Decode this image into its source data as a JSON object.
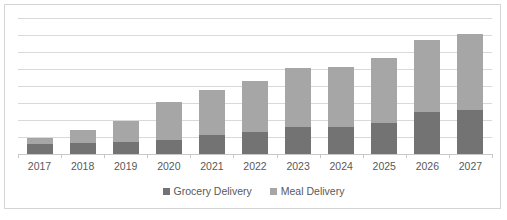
{
  "chart_data": {
    "type": "bar",
    "stacked": true,
    "title": "",
    "subtitle": "",
    "xlabel": "",
    "ylabel": "",
    "grid": true,
    "legend_position": "bottom",
    "ylim": [
      0,
      8
    ],
    "gridline_count": 9,
    "categories": [
      "2017",
      "2018",
      "2019",
      "2020",
      "2021",
      "2022",
      "2023",
      "2024",
      "2025",
      "2026",
      "2027"
    ],
    "series": [
      {
        "name": "Grocery Delivery",
        "color": "#737373",
        "values": [
          0.6,
          0.65,
          0.7,
          0.85,
          1.1,
          1.3,
          1.6,
          1.6,
          1.8,
          2.5,
          2.6
        ]
      },
      {
        "name": "Meal Delivery",
        "color": "#a6a6a6",
        "values": [
          0.35,
          0.75,
          1.25,
          2.2,
          2.65,
          3.0,
          3.45,
          3.5,
          3.85,
          4.2,
          4.45
        ]
      }
    ],
    "totals": [
      0.95,
      1.4,
      1.95,
      3.05,
      3.75,
      4.3,
      5.05,
      5.1,
      5.65,
      6.7,
      7.05
    ]
  },
  "legend": {
    "items": [
      {
        "label": "Grocery Delivery",
        "swatch": "grocery"
      },
      {
        "label": "Meal Delivery",
        "swatch": "meal"
      }
    ]
  },
  "colors": {
    "grocery": "#737373",
    "meal": "#a6a6a6",
    "gridline": "#d9d9d9",
    "border": "#d4d4d4",
    "text": "#595959",
    "background": "#ffffff"
  }
}
